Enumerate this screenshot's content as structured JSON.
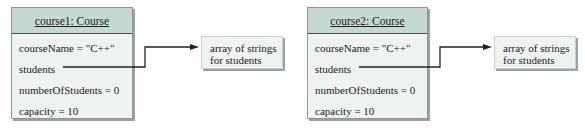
{
  "diagram": {
    "type": "object-diagram",
    "objects": [
      {
        "title": "course1: Course",
        "fields": {
          "courseName": "courseName = \"C++\"",
          "students": "students",
          "numberOfStudents": "numberOfStudents = 0",
          "capacity": "capacity = 10"
        },
        "reference": {
          "from_field": "students",
          "target_line1": "array of strings",
          "target_line2": "for students"
        }
      },
      {
        "title": "course2: Course",
        "fields": {
          "courseName": "courseName = \"C++\"",
          "students": "students",
          "numberOfStudents": "numberOfStudents = 0",
          "capacity": "capacity = 10"
        },
        "reference": {
          "from_field": "students",
          "target_line1": "array of strings",
          "target_line2": "for students"
        }
      }
    ],
    "colors": {
      "header_bg": "#c6d8d2",
      "body_bg": "#eef3f1",
      "line": "#222222",
      "shadow": "#9aa3a0"
    }
  }
}
